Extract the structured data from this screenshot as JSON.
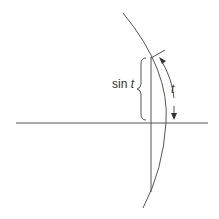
{
  "diagram": {
    "labels": {
      "sin": "sin",
      "sin_var": "t",
      "arc_var": "t"
    },
    "colors": {
      "stroke": "#555555",
      "text": "#333333",
      "background": "#ffffff"
    }
  }
}
